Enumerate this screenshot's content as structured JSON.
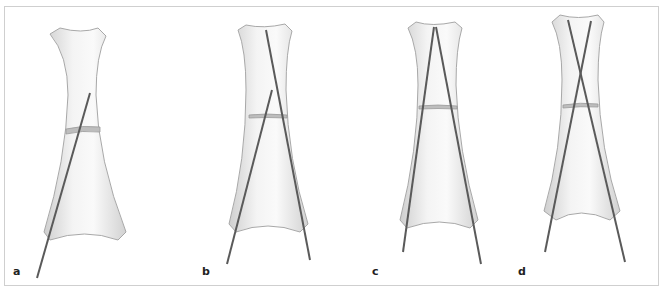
{
  "figure": {
    "panels": [
      {
        "id": "a",
        "label": "a",
        "pins": 1
      },
      {
        "id": "b",
        "label": "b",
        "pins": 2
      },
      {
        "id": "c",
        "label": "c",
        "pins": 2
      },
      {
        "id": "d",
        "label": "d",
        "pins": 2
      }
    ],
    "colors": {
      "bone_fill": "#e4e4e4",
      "bone_outline": "#a8a8a8",
      "pin": "#5a5a5a",
      "fracture": "#9a9a9a",
      "frame": "#cfcfcf"
    }
  }
}
